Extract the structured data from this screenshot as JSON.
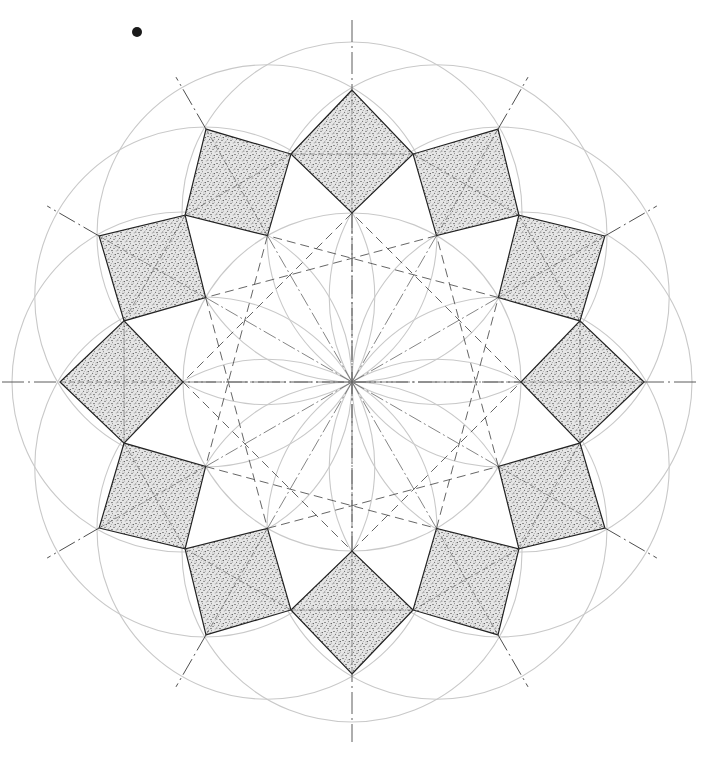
{
  "drawing": {
    "title": "Twelve-fold geometric rosette construction",
    "canvas": {
      "width": 725,
      "height": 773
    },
    "center": {
      "x": 352,
      "y": 382
    },
    "fold_count": 12,
    "squares": {
      "count": 12,
      "outer_vertex_radius": 292,
      "side_vertex_radius": 236,
      "side_vertex_angle_offset_deg": 15,
      "inner_vertex_radius": 169,
      "fill": "stippled",
      "fill_color": "#d8d8d8",
      "stipple_color": "#1e1e1e",
      "stroke_color": "#222222"
    },
    "petal_circles": {
      "count": 12,
      "radius": 170,
      "center_radius": 170,
      "stroke_color": "#c9c9c9"
    },
    "central_circle": {
      "radius": 169
    },
    "axes": {
      "horizontal": {
        "x1": 2,
        "x2": 700
      },
      "vertical": {
        "y1": 20,
        "y2": 742
      }
    },
    "radial_extensions": {
      "from_radius": 292,
      "to_radius": 352
    },
    "star_polygon": {
      "notation": "{12/3}",
      "step": 3,
      "style": "dashed"
    },
    "ink_spot": {
      "x": 137,
      "y": 32,
      "r": 5
    }
  }
}
